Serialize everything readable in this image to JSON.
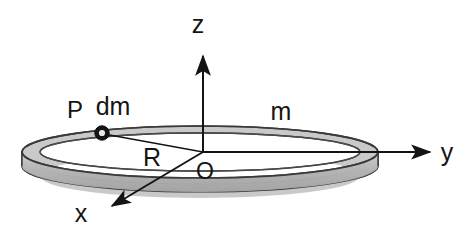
{
  "figure": {
    "type": "physics-diagram",
    "background_color": "#ffffff",
    "ink_color": "#141414",
    "ring_fill_color": "#b8b8b8",
    "ring_stroke_color": "#3a3a3a"
  },
  "axes": {
    "z": {
      "label": "z",
      "label_x": 198,
      "label_y": 33,
      "line_from": [
        203,
        152
      ],
      "line_to": [
        203,
        52
      ],
      "arrow_at": [
        203,
        48
      ],
      "direction": "up"
    },
    "y": {
      "label": "y",
      "label_x": 447,
      "label_y": 160,
      "line_from": [
        203,
        152
      ],
      "line_to": [
        427,
        152
      ],
      "arrow_at": [
        434,
        152
      ],
      "direction": "right"
    },
    "x": {
      "label": "x",
      "label_x": 81,
      "label_y": 221,
      "line_from": [
        203,
        152
      ],
      "line_to": [
        117,
        203
      ],
      "arrow_at": [
        108,
        209
      ],
      "direction": "down-left"
    }
  },
  "origin": {
    "label": "O",
    "label_x": 205,
    "label_y": 178,
    "point_x": 203,
    "point_y": 152
  },
  "ring": {
    "mass_label": "m",
    "mass_label_x": 272,
    "mass_label_y": 122,
    "center_x": 200,
    "center_y": 152,
    "radius_x": 178,
    "radius_y": 26,
    "band_depth": 14,
    "left_edge_x": 22,
    "right_edge_x": 378,
    "top_edge_y": 126,
    "bottom_edge_y": 178
  },
  "point_p": {
    "label": "P",
    "label_x": 75,
    "label_y": 116,
    "marker_x": 102,
    "marker_y": 133,
    "marker_outer_radius": 7,
    "marker_inner_radius": 3.2,
    "mass_element_label": "dm",
    "mass_element_label_x": 96,
    "mass_element_label_y": 113
  },
  "radius": {
    "label": "R",
    "label_x": 142,
    "label_y": 163,
    "line_from": [
      203,
      152
    ],
    "line_to": [
      104,
      134
    ]
  }
}
